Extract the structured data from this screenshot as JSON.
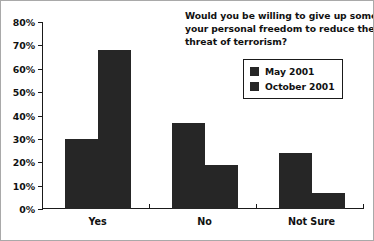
{
  "chart_data": {
    "type": "bar",
    "title": "Would you be willing to give up some of your personal freedom to reduce the threat of terrorism?",
    "title_lines": [
      "Would you be willing to give up some of",
      "your personal freedom to reduce the",
      "threat of terrorism?"
    ],
    "categories": [
      "Yes",
      "No",
      "Not Sure"
    ],
    "series": [
      {
        "name": "May 2001",
        "values": [
          30,
          37,
          24
        ],
        "color": "#262626"
      },
      {
        "name": "October 2001",
        "values": [
          68,
          19,
          7
        ],
        "color": "#262626"
      }
    ],
    "xlabel": "",
    "ylabel": "",
    "ylim": [
      0,
      80
    ],
    "ytick_values": [
      0,
      10,
      20,
      30,
      40,
      50,
      60,
      70,
      80
    ],
    "ytick_labels": [
      "0%",
      "10%",
      "20%",
      "30%",
      "40%",
      "50%",
      "60%",
      "70%",
      "80%"
    ],
    "grid": false,
    "legend_position": "top-right",
    "value_suffix": "%"
  },
  "legend": {
    "entries": [
      {
        "label": "May 2001",
        "swatch": "#262626"
      },
      {
        "label": "October 2001",
        "swatch": "#262626"
      }
    ]
  },
  "colors": {
    "axis": "#1a1a1a",
    "text": "#111111",
    "bar": "#262626",
    "background": "#ffffff",
    "frame": "#a9a9a9"
  }
}
